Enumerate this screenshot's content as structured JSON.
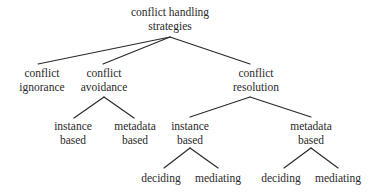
{
  "diagram": {
    "type": "tree",
    "root": {
      "line1": "conflict handling",
      "line2": "strategies"
    },
    "level1": {
      "ignorance": {
        "line1": "conflict",
        "line2": "ignorance"
      },
      "avoidance": {
        "line1": "conflict",
        "line2": "avoidance"
      },
      "resolution": {
        "line1": "conflict",
        "line2": "resolution"
      }
    },
    "avoidance_children": {
      "instance": {
        "line1": "instance",
        "line2": "based"
      },
      "metadata": {
        "line1": "metadata",
        "line2": "based"
      }
    },
    "resolution_children": {
      "instance": {
        "line1": "instance",
        "line2": "based"
      },
      "metadata": {
        "line1": "metadata",
        "line2": "based"
      }
    },
    "resolution_instance_children": {
      "deciding": "deciding",
      "mediating": "mediating"
    },
    "resolution_metadata_children": {
      "deciding": "deciding",
      "mediating": "mediating"
    },
    "colors": {
      "line": "#2a2a2a",
      "text": "#2a2a2a",
      "background": "#ffffff"
    }
  }
}
